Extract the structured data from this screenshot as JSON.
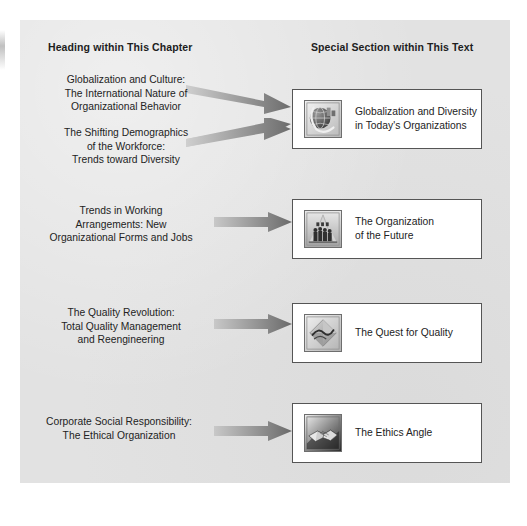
{
  "figure": {
    "background_color": "#e2e2e2",
    "page_color": "#ffffff",
    "box_border_color": "#555555",
    "arrow_color_light": "#c9c9c9",
    "arrow_color_dark": "#6e6e6e"
  },
  "headers": {
    "left": "Heading within This Chapter",
    "right": "Special Section within This Text"
  },
  "chapter_headings": [
    {
      "line1": "Globalization and Culture:",
      "line2": "The International Nature of",
      "line3": "Organizational Behavior"
    },
    {
      "line1": "The Shifting Demographics",
      "line2": "of the Workforce:",
      "line3": "Trends toward Diversity"
    },
    {
      "line1": "Trends in Working",
      "line2": "Arrangements: New",
      "line3": "Organizational Forms and Jobs"
    },
    {
      "line1": "The Quality Revolution:",
      "line2": "Total Quality Management",
      "line3": "and Reengineering"
    },
    {
      "line1": "Corporate Social Responsibility:",
      "line2": "The Ethical Organization",
      "line3": ""
    }
  ],
  "special_sections": [
    {
      "icon": "globe-icon",
      "line1": "Globalization and Diversity",
      "line2": "in Today's Organizations"
    },
    {
      "icon": "crowd-of-people-icon",
      "line1": "The Organization",
      "line2": "of the Future"
    },
    {
      "icon": "diamond-gem-icon",
      "line1": "The Quest for Quality",
      "line2": ""
    },
    {
      "icon": "handshake-icon",
      "line1": "The Ethics Angle",
      "line2": ""
    }
  ],
  "arrows": [
    {
      "name": "arrow-globalization-to-diversity-box"
    },
    {
      "name": "arrow-demographics-to-diversity-box"
    },
    {
      "name": "arrow-working-arrangements-to-organization-box"
    },
    {
      "name": "arrow-quality-to-quest-box"
    },
    {
      "name": "arrow-ethics-to-ethics-box"
    }
  ]
}
